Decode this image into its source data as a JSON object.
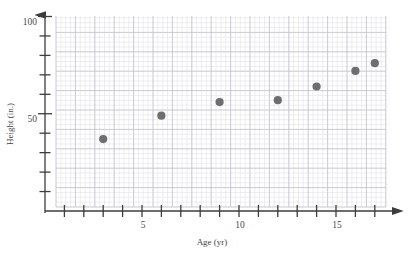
{
  "chart_data": {
    "type": "scatter",
    "title": "",
    "xlabel": "Age (yr)",
    "ylabel": "Height (in.)",
    "xlim": [
      0,
      18
    ],
    "ylim": [
      0,
      110
    ],
    "grid": true,
    "legend": "none",
    "x": [
      3,
      6,
      9,
      12,
      14,
      16,
      17
    ],
    "y": [
      37,
      49,
      56,
      57,
      64,
      72,
      76
    ],
    "points": [
      {
        "x": 3,
        "y": 37
      },
      {
        "x": 6,
        "y": 49
      },
      {
        "x": 9,
        "y": 56
      },
      {
        "x": 12,
        "y": 57
      },
      {
        "x": 14,
        "y": 64
      },
      {
        "x": 16,
        "y": 72
      },
      {
        "x": 17,
        "y": 76
      }
    ],
    "x_tick_labels": [
      {
        "value": 5,
        "label": "5"
      },
      {
        "value": 10,
        "label": "10"
      },
      {
        "value": 15,
        "label": "15"
      }
    ],
    "y_tick_labels": [
      {
        "value": 50,
        "label": "50"
      },
      {
        "value": 100,
        "label": "100"
      }
    ],
    "x_ticks_all": [
      1,
      2,
      3,
      4,
      5,
      6,
      7,
      8,
      9,
      10,
      11,
      12,
      13,
      14,
      15,
      16,
      17
    ],
    "y_ticks_all": [
      10,
      20,
      30,
      40,
      50,
      60,
      70,
      80,
      90,
      100
    ],
    "marker_color": "#6e6e6e",
    "axis_color": "#3d3d3d",
    "grid_color_minor": "#dcdce4",
    "grid_color_major": "#c2c2cf"
  },
  "labels": {
    "x_axis_title": "Age (yr)",
    "y_axis_title": "Height (in.)",
    "y_100": "100",
    "y_50": "50",
    "x_5": "5",
    "x_10": "10",
    "x_15": "15"
  }
}
